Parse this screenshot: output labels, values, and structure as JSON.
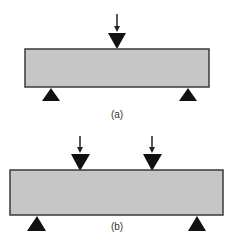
{
  "diagram": {
    "colors": {
      "beam_fill": "#c6c6c6",
      "beam_border": "#3a3a3a",
      "support": "#111111",
      "load": "#111111",
      "tint_line": "#d8c4c4"
    },
    "panels": [
      {
        "id": "a",
        "caption": "(a)",
        "type": "three-point bending",
        "beam": {
          "x": 25,
          "y": 49,
          "width": 184,
          "height": 38
        },
        "loads": [
          {
            "x": 117
          }
        ],
        "supports": [
          {
            "x": 51
          },
          {
            "x": 188
          }
        ]
      },
      {
        "id": "b",
        "caption": "(b)",
        "type": "four-point bending",
        "beam": {
          "x": 10,
          "y": 170,
          "width": 213,
          "height": 45
        },
        "loads": [
          {
            "x": 80
          },
          {
            "x": 152
          }
        ],
        "supports": [
          {
            "x": 37
          },
          {
            "x": 197
          }
        ]
      }
    ]
  }
}
